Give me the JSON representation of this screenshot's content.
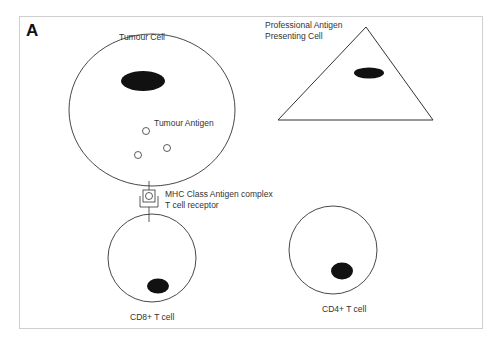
{
  "figure": {
    "panel_label": "A",
    "labels": {
      "tumour_cell": "Tumour Cell",
      "tumour_antigen": "Tumour Antigen",
      "apc_line1": "Professional Antigen",
      "apc_line2": "Presenting Cell",
      "mhc_complex": "MHC Class  Antigen complex",
      "tcr": "T cell receptor",
      "cd8": "CD8+ T cell",
      "cd4": "CD4+ T cell"
    },
    "colors": {
      "stroke": "#333333",
      "nucleus": "#111111",
      "border": "#cfcfcf"
    }
  }
}
